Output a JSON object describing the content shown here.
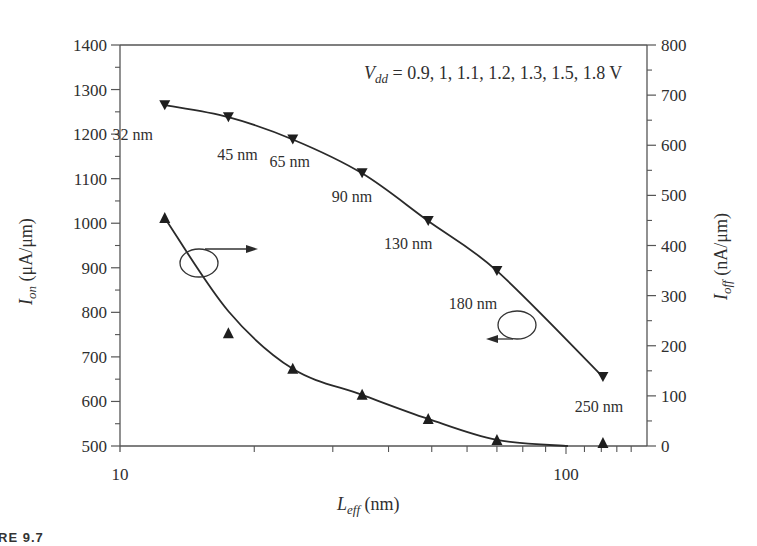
{
  "caption": "RE 9.7",
  "annotation": {
    "vdd_symbol": "V",
    "vdd_subscript": "dd",
    "vdd_values": " = 0.9, 1, 1.1, 1.2, 1.3, 1.5, 1.8 V"
  },
  "axes": {
    "x_label_main": "L",
    "x_label_sub": "eff",
    "x_label_unit": " (nm)",
    "y_left_label_main": "I",
    "y_left_label_sub": "on",
    "y_left_label_unit": " (μA/μm)",
    "y_right_label_main": "I",
    "y_right_label_sub": "off",
    "y_right_label_unit": " (nA/μm)"
  },
  "colors": {
    "line": "#2a2a2a",
    "axis": "#555555",
    "text": "#2f2f2f"
  },
  "chart_data": {
    "type": "line",
    "title": "",
    "xlabel": "L_eff (nm)",
    "ylabel": "I_on (μA/μm)",
    "y2label": "I_off (nA/μm)",
    "xscale": "log",
    "xlim": [
      10,
      150
    ],
    "ylim": [
      500,
      1400
    ],
    "y2lim": [
      0,
      800
    ],
    "x_ticks": [
      10,
      100
    ],
    "y_ticks": [
      500,
      600,
      700,
      800,
      900,
      1000,
      1100,
      1200,
      1300,
      1400
    ],
    "y2_ticks": [
      0,
      100,
      200,
      300,
      400,
      500,
      600,
      700,
      800
    ],
    "grid": false,
    "annotation_text": "V_dd = 0.9, 1, 1.1, 1.2, 1.3, 1.5, 1.8 V",
    "x": [
      12.6,
      17.5,
      24.4,
      34.9,
      49.1,
      70,
      121
    ],
    "node_labels": [
      "32 nm",
      "45 nm",
      "65 nm",
      "90 nm",
      "130 nm",
      "180 nm",
      "250 nm"
    ],
    "series": [
      {
        "name": "I_on",
        "axis": "left",
        "marker": "triangle-down",
        "values": [
          1265,
          1238,
          1188,
          1112,
          1005,
          893,
          655
        ]
      },
      {
        "name": "I_off",
        "axis": "right",
        "marker": "triangle-up",
        "values": [
          455,
          225,
          154,
          102,
          54,
          12,
          6
        ]
      }
    ]
  }
}
